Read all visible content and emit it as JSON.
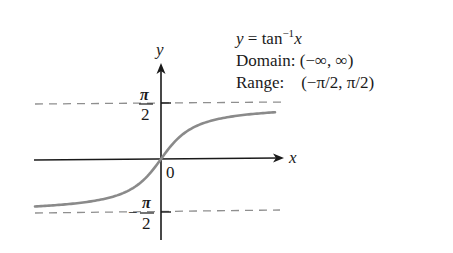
{
  "chart_data": {
    "type": "line",
    "function": "arctan",
    "xlabel": "x",
    "ylabel": "y",
    "origin_label": "0",
    "asymptotes": [
      {
        "value": 1.5707963,
        "label": "π/2",
        "style": "dashed"
      },
      {
        "value": -1.5707963,
        "label": "−π/2",
        "style": "dashed"
      }
    ],
    "ytick_labels": [
      "π/2",
      "−π/2"
    ],
    "domain": "(−∞, ∞)",
    "range": "(−π/2, π/2)",
    "x": [
      -5,
      -4,
      -3,
      -2,
      -1,
      -0.5,
      0,
      0.5,
      1,
      2,
      3,
      4,
      5
    ],
    "values": [
      -1.3734,
      -1.3258,
      -1.249,
      -1.1071,
      -0.7854,
      -0.4636,
      0,
      0.4636,
      0.7854,
      1.1071,
      1.249,
      1.3258,
      1.3734
    ],
    "grid": false,
    "legend": "none"
  },
  "annotation": {
    "eq_lhs": "y",
    "eq_mid": " = tan",
    "eq_sup": "−1",
    "eq_rhs": "x",
    "domain_label": "Domain:",
    "domain_value": " (−∞, ∞)",
    "range_label": "Range:",
    "range_value": "    (−π/2, π/2)"
  },
  "axis_labels": {
    "x": "x",
    "y": "y",
    "origin": "0",
    "pi": "π",
    "two": "2",
    "minus": "−"
  },
  "colors": {
    "curve": "#8a8a8a",
    "axes": "#1a1a1a",
    "asymptote": "#8f8f8f"
  }
}
